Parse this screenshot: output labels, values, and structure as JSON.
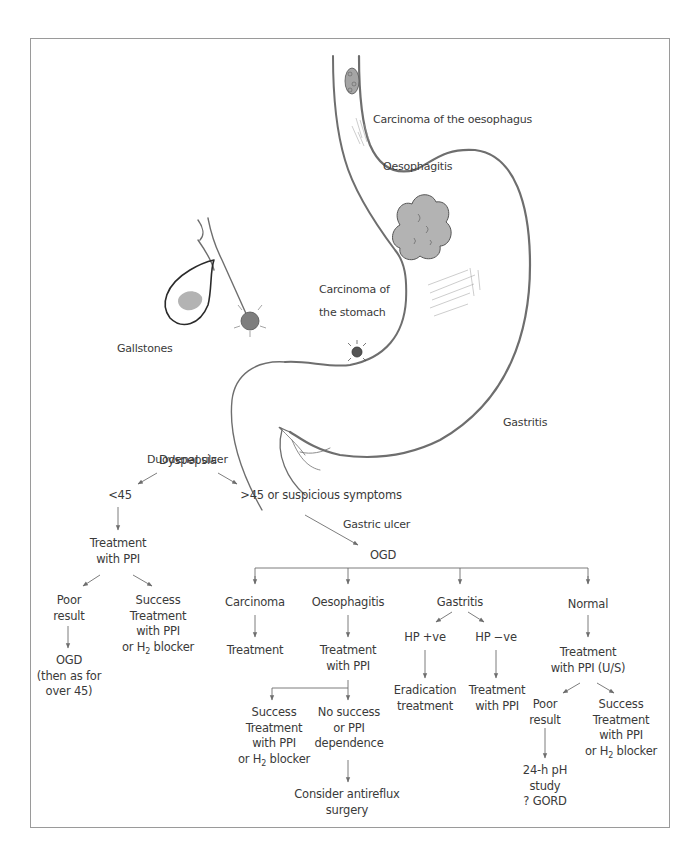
{
  "illustration": {
    "labels": {
      "carcinoma_oesophagus": "Carcinoma of the oesophagus",
      "oesophagitis": "Oesophagitis",
      "carcinoma_stomach_line1": "Carcinoma of",
      "carcinoma_stomach_line2": "the stomach",
      "gallstones": "Gallstones",
      "gastritis": "Gastritis",
      "duodenal_ulcer": "Duodenal ulcer",
      "gastric_ulcer": "Gastric ulcer"
    },
    "colors": {
      "outline": "#6e6e6e",
      "lesion_fill": "#b3b3b3",
      "frame": "#9a9a9a",
      "text": "#3a3a3a"
    }
  },
  "flowchart": {
    "root": "Dyspepsia",
    "under45": {
      "label": "<45",
      "treatment": [
        "Treatment",
        "with PPI"
      ],
      "poor": [
        "Poor",
        "result"
      ],
      "poor_next": [
        "OGD",
        "(then as for",
        "over 45)"
      ],
      "success": [
        "Success",
        "Treatment",
        "with PPI"
      ],
      "success_last_prefix": "or H",
      "success_last_sub": "2",
      "success_last_suffix": " blocker"
    },
    "over45": {
      "label": ">45 or suspicious symptoms",
      "ogd": "OGD",
      "branches": {
        "carcinoma": {
          "label": "Carcinoma",
          "next": "Treatment"
        },
        "oesophagitis": {
          "label": "Oesophagitis",
          "next": [
            "Treatment",
            "with PPI"
          ],
          "success": [
            "Success",
            "Treatment",
            "with PPI"
          ],
          "success_last_prefix": "or H",
          "success_last_sub": "2",
          "success_last_suffix": " blocker",
          "no_success": [
            "No success",
            "or PPI",
            "dependence"
          ],
          "surgery": [
            "Consider antireflux",
            "surgery"
          ]
        },
        "gastritis": {
          "label": "Gastritis",
          "hp_pos": "HP +ve",
          "hp_pos_next": [
            "Eradication",
            "treatment"
          ],
          "hp_neg": "HP −ve",
          "hp_neg_next": [
            "Treatment",
            "with PPI"
          ]
        },
        "normal": {
          "label": "Normal",
          "next": [
            "Treatment",
            "with PPI (U/S)"
          ],
          "poor": [
            "Poor",
            "result"
          ],
          "poor_next": [
            "24-h pH",
            "study",
            "? GORD"
          ],
          "success": [
            "Success",
            "Treatment",
            "with PPI"
          ],
          "success_last_prefix": "or H",
          "success_last_sub": "2",
          "success_last_suffix": " blocker"
        }
      }
    }
  }
}
